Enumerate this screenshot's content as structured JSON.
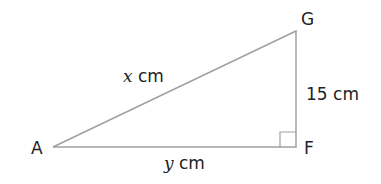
{
  "diagram": {
    "type": "right-triangle",
    "line_color": "#a0a0a0",
    "text_color": "#222222",
    "vertices": {
      "A": {
        "label": "A",
        "x": 53,
        "y": 147
      },
      "F": {
        "label": "F",
        "x": 296,
        "y": 147
      },
      "G": {
        "label": "G",
        "x": 296,
        "y": 31
      }
    },
    "right_angle_at": "F",
    "sides": {
      "AG": {
        "var": "x",
        "unit": "cm"
      },
      "AF": {
        "var": "y",
        "unit": "cm"
      },
      "GF": {
        "value": "15 cm"
      }
    }
  }
}
